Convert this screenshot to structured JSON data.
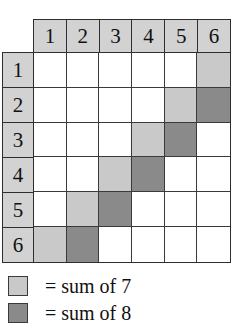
{
  "table": {
    "column_headers": [
      "1",
      "2",
      "3",
      "4",
      "5",
      "6"
    ],
    "row_headers": [
      "1",
      "2",
      "3",
      "4",
      "5",
      "6"
    ],
    "cells": [
      [
        "",
        "",
        "",
        "",
        "",
        ""
      ],
      [
        "",
        "",
        "",
        "",
        "",
        ""
      ],
      [
        "",
        "",
        "",
        "",
        "",
        ""
      ],
      [
        "",
        "",
        "",
        "",
        "",
        ""
      ],
      [
        "",
        "",
        "",
        "",
        "",
        ""
      ],
      [
        "",
        "",
        "",
        "",
        "",
        ""
      ]
    ],
    "shading": [
      [
        "none",
        "none",
        "none",
        "none",
        "none",
        "light"
      ],
      [
        "none",
        "none",
        "none",
        "none",
        "light",
        "dark"
      ],
      [
        "none",
        "none",
        "none",
        "light",
        "dark",
        "none"
      ],
      [
        "none",
        "none",
        "light",
        "dark",
        "none",
        "none"
      ],
      [
        "none",
        "light",
        "dark",
        "none",
        "none",
        "none"
      ],
      [
        "light",
        "dark",
        "none",
        "none",
        "none",
        "none"
      ]
    ]
  },
  "legend": {
    "items": [
      {
        "swatch": "light",
        "label": "= sum of 7"
      },
      {
        "swatch": "dark",
        "label": "= sum of 8"
      }
    ]
  },
  "colors": {
    "light_gray": "#c9c9c9",
    "dark_gray": "#8a8a8a",
    "header_gray": "#d2d2d2",
    "line": "#2e2e2e",
    "background": "#ffffff",
    "text": "#111111"
  }
}
